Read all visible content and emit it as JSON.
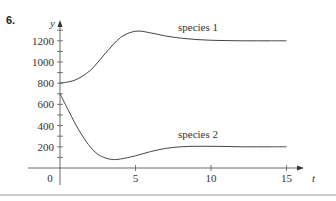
{
  "problem_number": "6.",
  "chart_data": {
    "type": "line",
    "title": "",
    "xlabel": "t",
    "ylabel": "y",
    "xlim": [
      0,
      16
    ],
    "ylim": [
      0,
      1350
    ],
    "x_ticks": [
      5,
      10,
      15
    ],
    "y_ticks": [
      200,
      400,
      600,
      800,
      1000,
      1200
    ],
    "origin_label": "0",
    "grid": false,
    "series": [
      {
        "name": "species 1",
        "x": [
          0,
          1,
          2,
          3,
          4,
          5,
          6,
          7,
          8,
          9,
          10,
          11,
          12,
          13,
          14,
          15
        ],
        "values": [
          800,
          830,
          920,
          1080,
          1230,
          1290,
          1275,
          1245,
          1225,
          1212,
          1205,
          1202,
          1200,
          1200,
          1200,
          1200
        ]
      },
      {
        "name": "species 2",
        "x": [
          0,
          0.5,
          1,
          1.5,
          2,
          2.5,
          3,
          3.5,
          4,
          5,
          6,
          7,
          8,
          9,
          10,
          11,
          12,
          13,
          14,
          15
        ],
        "values": [
          700,
          560,
          420,
          300,
          200,
          130,
          95,
          80,
          85,
          115,
          155,
          185,
          200,
          205,
          205,
          203,
          200,
          200,
          200,
          200
        ]
      }
    ]
  }
}
